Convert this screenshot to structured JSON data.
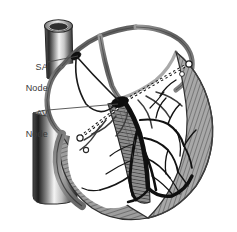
{
  "figure": {
    "background_color": "#ffffff",
    "width": 237,
    "height": 232,
    "style": "grayscale pen-and-ink anatomical illustration"
  },
  "annotations": [
    {
      "id": "sa-node",
      "label": "SA\nNode",
      "line1": "SA",
      "line2": "Node",
      "label_x": 14,
      "label_y": 51,
      "leader_from_x": 48,
      "leader_from_y": 62,
      "leader_to_x": 76,
      "leader_to_y": 56,
      "color": "#3a3a3a"
    },
    {
      "id": "av-node",
      "label": "AV\nNode",
      "line1": "AV",
      "line2": "Node",
      "label_x": 14,
      "label_y": 97,
      "leader_from_x": 48,
      "leader_from_y": 110,
      "leader_to_x": 118,
      "leader_to_y": 105,
      "color": "#3a3a3a"
    }
  ],
  "structures": {
    "superior_vena_cava": "cut cylindrical vessel, upper left",
    "inferior_vena_cava": "cut cylindrical vessel, lower left",
    "right_atrium": "upper left chamber",
    "left_atrium": "upper right chamber",
    "right_ventricle": "lower left chamber",
    "left_ventricle": "lower right chamber with thick striated wall",
    "sa_node": "dark ovoid at junction of superior vena cava and right atrium",
    "av_node": "dark ovoid at base of interatrial septum",
    "bundle_of_his": "dark band descending interventricular septum",
    "bundle_branches": "paired dark fibers on septum",
    "purkinje_fibers": "fine branching dark network in ventricular walls",
    "valve_plane_hatching": "dashed hatched bands marking atrioventricular valve planes",
    "myocardium_striation": "radial gray hatching in ventricular free walls"
  },
  "palette": {
    "ink_black": "#111111",
    "dark_gray": "#3a3a3a",
    "mid_gray": "#7b7b7b",
    "light_gray": "#b9b9b9",
    "pale_gray": "#d8d8d8",
    "paper": "#ffffff"
  }
}
